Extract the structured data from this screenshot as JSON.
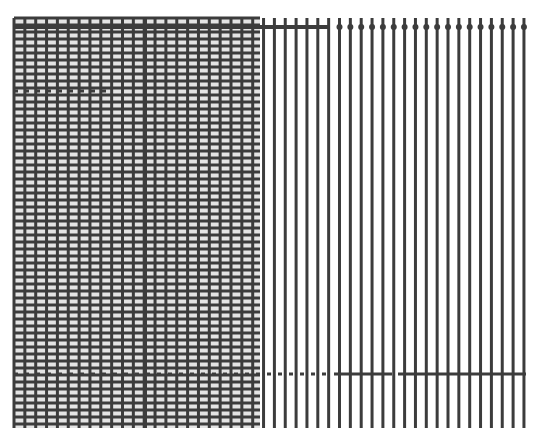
{
  "canvas": {
    "width": 543,
    "height": 440,
    "background": "#ffffff"
  },
  "style": {
    "line_color": "#3c3c3c",
    "light_band": "#e4e4e4"
  },
  "grid": {
    "top": 18,
    "bottom": 428,
    "vertical": {
      "x_start": 14,
      "spacing": 10.85,
      "count": 48,
      "width": 3,
      "thick_x": 145,
      "thick_width": 4
    },
    "hatched_region": {
      "x_start": 14,
      "x_end": 260,
      "row_spacing": 7.0,
      "row_width": 3
    },
    "top_line": {
      "y": 27,
      "solid_x": [
        14,
        330
      ],
      "dots_from": 330,
      "dots_to": 526
    },
    "dashed_row_upper": {
      "y": 91,
      "x": [
        14,
        110
      ]
    },
    "dashed_row_lower": {
      "y": 374,
      "dashed_x": [
        14,
        330
      ],
      "solid_segments": [
        [
          334,
          392
        ],
        [
          398,
          526
        ]
      ]
    }
  }
}
